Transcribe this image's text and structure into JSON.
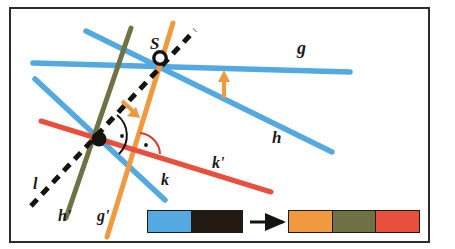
{
  "figure": {
    "background": "#ffffff",
    "frame_color": "#2b2b2b"
  },
  "labels": {
    "S": "S",
    "g": "g",
    "h": "h",
    "k": "k",
    "k_prime": "k'",
    "l": "l",
    "h_prime": "h'",
    "g_prime": "g'"
  },
  "colors": {
    "blue": "#53a9e0",
    "blue_dark": "#3f93d4",
    "orange": "#f0993f",
    "olive": "#6f7245",
    "red": "#e8503c",
    "black": "#151510",
    "frame": "#2b2b2b",
    "white": "#ffffff"
  },
  "lines": [
    {
      "name": "g",
      "label": "g",
      "color": "#53a9e0",
      "style": "solid",
      "role": "original"
    },
    {
      "name": "h",
      "label": "h",
      "color": "#53a9e0",
      "style": "solid",
      "role": "original"
    },
    {
      "name": "k",
      "label": "k",
      "color": "#53a9e0",
      "style": "solid",
      "role": "original"
    },
    {
      "name": "l",
      "label": "l",
      "color": "#151510",
      "style": "dashed",
      "role": "axis"
    },
    {
      "name": "g'",
      "label": "g'",
      "color": "#f0993f",
      "style": "solid",
      "role": "image"
    },
    {
      "name": "h'",
      "label": "h'",
      "color": "#6f7245",
      "style": "solid",
      "role": "image"
    },
    {
      "name": "k'",
      "label": "k'",
      "color": "#e8503c",
      "style": "solid",
      "role": "image"
    }
  ],
  "points": [
    {
      "name": "S",
      "label": "S",
      "marker": "open-circle",
      "x": 160,
      "y": 58
    },
    {
      "name": "intersection",
      "label": "",
      "marker": "filled-dot",
      "x": 99,
      "y": 139
    }
  ],
  "markers": {
    "right_angle_count": 2,
    "arrow_count": 2,
    "arrow_color": "#f0993f"
  },
  "legend": {
    "source_bar": {
      "segments": [
        {
          "name": "blue-segment",
          "color": "#53a9e0"
        },
        {
          "name": "black-segment",
          "color": "#221a12"
        }
      ]
    },
    "arrow": {
      "name": "maps-to-arrow",
      "color": "#151510"
    },
    "result_bar": {
      "segments": [
        {
          "name": "orange-segment",
          "color": "#f0993f"
        },
        {
          "name": "olive-segment",
          "color": "#6f7245"
        },
        {
          "name": "red-segment",
          "color": "#e8503c"
        }
      ]
    }
  }
}
